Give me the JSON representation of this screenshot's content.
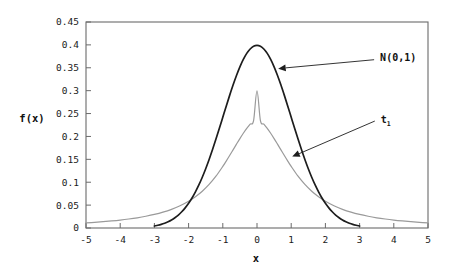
{
  "chart_data": {
    "type": "line",
    "title": "",
    "subtitle": "",
    "xlabel": "x",
    "ylabel": "f(x)",
    "xlim": [
      -5,
      5
    ],
    "ylim": [
      0,
      0.45
    ],
    "grid": false,
    "legend_position": "inline-annotations",
    "x_ticks": [
      "-5",
      "-4",
      "-3",
      "-2",
      "-1",
      "0",
      "1",
      "2",
      "3",
      "4",
      "5"
    ],
    "x_tick_values": [
      -5,
      -4,
      -3,
      -2,
      -1,
      0,
      1,
      2,
      3,
      4,
      5
    ],
    "y_ticks": [
      "0",
      "0.05",
      "0.1",
      "0.15",
      "0.2",
      "0.25",
      "0.3",
      "0.35",
      "0.4",
      "0.45"
    ],
    "y_tick_values": [
      0,
      0.05,
      0.1,
      0.15,
      0.2,
      0.25,
      0.3,
      0.35,
      0.4,
      0.45
    ],
    "series": [
      {
        "name": "N(0,1)",
        "color": "#1d1d1d",
        "peak": 0.399,
        "x": [
          -3.0,
          -2.9,
          -2.8,
          -2.7,
          -2.6,
          -2.5,
          -2.4,
          -2.3,
          -2.2,
          -2.1,
          -2.0,
          -1.9,
          -1.8,
          -1.7,
          -1.6,
          -1.5,
          -1.4,
          -1.3,
          -1.2,
          -1.1,
          -1.0,
          -0.9,
          -0.8,
          -0.7,
          -0.6,
          -0.5,
          -0.4,
          -0.3,
          -0.2,
          -0.1,
          0.0,
          0.1,
          0.2,
          0.3,
          0.4,
          0.5,
          0.6,
          0.7,
          0.8,
          0.9,
          1.0,
          1.1,
          1.2,
          1.3,
          1.4,
          1.5,
          1.6,
          1.7,
          1.8,
          1.9,
          2.0,
          2.1,
          2.2,
          2.3,
          2.4,
          2.5,
          2.6,
          2.7,
          2.8,
          2.9,
          3.0
        ],
        "values": [
          0.0044,
          0.006,
          0.0079,
          0.0104,
          0.0136,
          0.0175,
          0.0224,
          0.0283,
          0.0355,
          0.044,
          0.054,
          0.0656,
          0.079,
          0.094,
          0.1109,
          0.1295,
          0.1497,
          0.1714,
          0.1942,
          0.2179,
          0.242,
          0.2661,
          0.2897,
          0.3123,
          0.3332,
          0.3521,
          0.3683,
          0.3814,
          0.391,
          0.397,
          0.3989,
          0.397,
          0.391,
          0.3814,
          0.3683,
          0.3521,
          0.3332,
          0.3123,
          0.2897,
          0.2661,
          0.242,
          0.2179,
          0.1942,
          0.1714,
          0.1497,
          0.1295,
          0.1109,
          0.094,
          0.079,
          0.0656,
          0.054,
          0.044,
          0.0355,
          0.0283,
          0.0224,
          0.0175,
          0.0136,
          0.0104,
          0.0079,
          0.006,
          0.0044
        ]
      },
      {
        "name": "t1",
        "color": "#9a9a9a",
        "peak": 0.3,
        "x": [
          -5.0,
          -4.75,
          -4.5,
          -4.25,
          -4.0,
          -3.75,
          -3.5,
          -3.25,
          -3.0,
          -2.75,
          -2.5,
          -2.25,
          -2.0,
          -1.8,
          -1.6,
          -1.4,
          -1.2,
          -1.0,
          -0.9,
          -0.8,
          -0.7,
          -0.6,
          -0.5,
          -0.4,
          -0.3,
          -0.2,
          -0.1,
          0.0,
          0.1,
          0.2,
          0.3,
          0.4,
          0.5,
          0.6,
          0.7,
          0.8,
          0.9,
          1.0,
          1.2,
          1.4,
          1.6,
          1.8,
          2.0,
          2.25,
          2.5,
          2.75,
          3.0,
          3.25,
          3.5,
          3.75,
          4.0,
          4.25,
          4.5,
          4.75,
          5.0
        ],
        "values": [
          0.0112,
          0.0124,
          0.0138,
          0.0154,
          0.0173,
          0.0196,
          0.0223,
          0.0256,
          0.0296,
          0.0346,
          0.0408,
          0.0486,
          0.0585,
          0.0683,
          0.0803,
          0.0951,
          0.1131,
          0.1345,
          0.1462,
          0.1583,
          0.1707,
          0.1831,
          0.1953,
          0.2069,
          0.2176,
          0.2269,
          0.2344,
          0.2998,
          0.2344,
          0.2269,
          0.2176,
          0.2069,
          0.1953,
          0.1831,
          0.1707,
          0.1583,
          0.1462,
          0.1345,
          0.1131,
          0.0951,
          0.0803,
          0.0683,
          0.0585,
          0.0486,
          0.0408,
          0.0346,
          0.0296,
          0.0256,
          0.0223,
          0.0196,
          0.0173,
          0.0154,
          0.0138,
          0.0124,
          0.0112
        ]
      }
    ],
    "annotations": [
      {
        "label": "N(0,1)",
        "base": "N(0,1)",
        "subscript": "",
        "text_x": 3.6,
        "text_y": 0.372,
        "point_x": 0.62,
        "point_y": 0.348
      },
      {
        "label": "t1",
        "base": "t",
        "subscript": "1",
        "text_x": 3.62,
        "text_y": 0.238,
        "point_x": 1.03,
        "point_y": 0.156
      }
    ]
  }
}
